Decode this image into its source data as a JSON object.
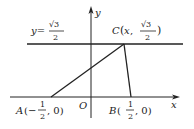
{
  "figure": {
    "axes": {
      "x_label": "x",
      "y_label": "y",
      "origin_label": "O"
    },
    "line_label": {
      "prefix": "y=",
      "sqrt": "√3",
      "denominator": "2"
    },
    "points": {
      "A": {
        "name": "A",
        "open": "(−",
        "num": "1",
        "den": "2",
        "close": ", 0)"
      },
      "B": {
        "name": "B",
        "open": "(",
        "num": "1",
        "den": "2",
        "close": ", 0)"
      },
      "C": {
        "name": "C",
        "open": "(",
        "var": "x",
        "sep": ", ",
        "num": "√3",
        "den": "2",
        "close": ")"
      }
    },
    "stroke_color": "#222222"
  }
}
